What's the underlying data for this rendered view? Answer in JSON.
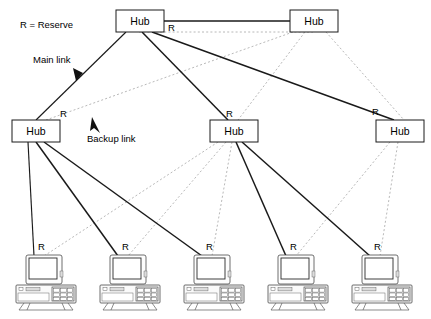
{
  "diagram": {
    "legend": {
      "reserve_key": "R = Reserve",
      "main_link_label": "Main link",
      "backup_link_label": "Backup link"
    },
    "labels": {
      "hub": "Hub",
      "reserve_marker": "R"
    },
    "colors": {
      "main_link": "#1a1a1a",
      "backup_link": "#b0b0b0",
      "node_fill": "#ffffff",
      "node_stroke": "#1a1a1a",
      "text": "#000000"
    },
    "nodes": [
      {
        "id": "hub-top-left",
        "type": "hub",
        "label": "Hub",
        "x": 116,
        "y": 10,
        "w": 48,
        "h": 22,
        "tier": "core"
      },
      {
        "id": "hub-top-right",
        "type": "hub",
        "label": "Hub",
        "x": 290,
        "y": 10,
        "w": 48,
        "h": 22,
        "tier": "core"
      },
      {
        "id": "hub-mid-left",
        "type": "hub",
        "label": "Hub",
        "x": 12,
        "y": 120,
        "w": 48,
        "h": 22,
        "tier": "distribution"
      },
      {
        "id": "hub-mid-center",
        "type": "hub",
        "label": "Hub",
        "x": 210,
        "y": 120,
        "w": 48,
        "h": 22,
        "tier": "distribution"
      },
      {
        "id": "hub-mid-right",
        "type": "hub",
        "label": "Hub",
        "x": 376,
        "y": 120,
        "w": 48,
        "h": 22,
        "tier": "distribution"
      },
      {
        "id": "workstation-1",
        "type": "computer",
        "x": 16,
        "y": 255,
        "tier": "access"
      },
      {
        "id": "workstation-2",
        "type": "computer",
        "x": 100,
        "y": 255,
        "tier": "access"
      },
      {
        "id": "workstation-3",
        "type": "computer",
        "x": 184,
        "y": 255,
        "tier": "access"
      },
      {
        "id": "workstation-4",
        "type": "computer",
        "x": 268,
        "y": 255,
        "tier": "access"
      },
      {
        "id": "workstation-5",
        "type": "computer",
        "x": 352,
        "y": 255,
        "tier": "access"
      }
    ],
    "links": [
      {
        "id": "link-core-main",
        "from": "hub-top-left",
        "to": "hub-top-right",
        "kind": "main",
        "marker": null
      },
      {
        "id": "link-core-backup",
        "from": "hub-top-left",
        "to": "hub-top-right",
        "kind": "backup",
        "marker": "R"
      },
      {
        "id": "link-tl-ml",
        "from": "hub-top-left",
        "to": "hub-mid-left",
        "kind": "main",
        "marker": "R"
      },
      {
        "id": "link-tl-mc",
        "from": "hub-top-left",
        "to": "hub-mid-center",
        "kind": "main",
        "marker": "R"
      },
      {
        "id": "link-tl-mr",
        "from": "hub-top-left",
        "to": "hub-mid-right",
        "kind": "main",
        "marker": "R"
      },
      {
        "id": "link-tr-ml",
        "from": "hub-top-right",
        "to": "hub-mid-left",
        "kind": "backup",
        "marker": null
      },
      {
        "id": "link-tr-mc",
        "from": "hub-top-right",
        "to": "hub-mid-center",
        "kind": "backup",
        "marker": null
      },
      {
        "id": "link-tr-mr",
        "from": "hub-top-right",
        "to": "hub-mid-right",
        "kind": "backup",
        "marker": null
      },
      {
        "id": "link-ml-ws1",
        "from": "hub-mid-left",
        "to": "workstation-1",
        "kind": "main",
        "marker": "R"
      },
      {
        "id": "link-ml-ws2",
        "from": "hub-mid-left",
        "to": "workstation-2",
        "kind": "main",
        "marker": "R"
      },
      {
        "id": "link-ml-ws3",
        "from": "hub-mid-left",
        "to": "workstation-3",
        "kind": "main",
        "marker": "R"
      },
      {
        "id": "link-mc-ws4",
        "from": "hub-mid-center",
        "to": "workstation-4",
        "kind": "main",
        "marker": "R"
      },
      {
        "id": "link-mc-ws5",
        "from": "hub-mid-center",
        "to": "workstation-5",
        "kind": "main",
        "marker": "R"
      },
      {
        "id": "link-mc-ws1",
        "from": "hub-mid-center",
        "to": "workstation-1",
        "kind": "backup",
        "marker": null
      },
      {
        "id": "link-mc-ws2",
        "from": "hub-mid-center",
        "to": "workstation-2",
        "kind": "backup",
        "marker": null
      },
      {
        "id": "link-mc-ws3",
        "from": "hub-mid-center",
        "to": "workstation-3",
        "kind": "backup",
        "marker": null
      },
      {
        "id": "link-mr-ws4",
        "from": "hub-mid-right",
        "to": "workstation-4",
        "kind": "backup",
        "marker": null
      },
      {
        "id": "link-mr-ws5",
        "from": "hub-mid-right",
        "to": "workstation-5",
        "kind": "backup",
        "marker": null
      }
    ],
    "reserve_markers": [
      {
        "id": "r-core",
        "text": "R",
        "x": 169,
        "y": 28
      },
      {
        "id": "r-ml",
        "text": "R",
        "x": 61,
        "y": 116
      },
      {
        "id": "r-mc",
        "text": "R",
        "x": 226,
        "y": 116
      },
      {
        "id": "r-mr",
        "text": "R",
        "x": 374,
        "y": 114
      },
      {
        "id": "r-ws1",
        "text": "R",
        "x": 38,
        "y": 248
      },
      {
        "id": "r-ws2",
        "text": "R",
        "x": 122,
        "y": 248
      },
      {
        "id": "r-ws3",
        "text": "R",
        "x": 206,
        "y": 248
      },
      {
        "id": "r-ws4",
        "text": "R",
        "x": 290,
        "y": 248
      },
      {
        "id": "r-ws5",
        "text": "R",
        "x": 374,
        "y": 248
      }
    ]
  }
}
